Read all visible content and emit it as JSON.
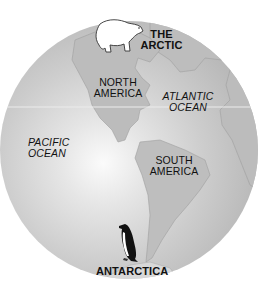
{
  "map": {
    "type": "globe-hemisphere",
    "colors": {
      "background": "#ffffff",
      "ocean": "#c8c8c8",
      "ocean_highlight": "#f4f4f4",
      "land": "#b9b9b9",
      "land_edge": "#9a9a9a",
      "text": "#111111"
    },
    "labels": {
      "arctic": {
        "line1": "THE",
        "line2": "ARCTIC"
      },
      "north_america": {
        "line1": "NORTH",
        "line2": "AMERICA"
      },
      "atlantic": {
        "line1": "ATLANTIC",
        "line2": "OCEAN"
      },
      "pacific": {
        "line1": "PACIFIC",
        "line2": "OCEAN"
      },
      "south_america": {
        "line1": "SOUTH",
        "line2": "AMERICA"
      },
      "antarctica": {
        "line1": "ANTARCTICA"
      }
    },
    "icons": [
      "polar-bear-icon",
      "penguin-icon"
    ]
  }
}
